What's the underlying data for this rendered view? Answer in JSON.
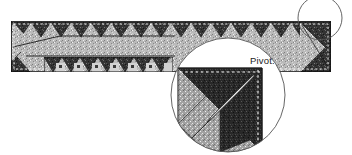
{
  "figure": {
    "kind": "quilting-instruction-diagram",
    "background_color": "#ffffff",
    "ink_color": "#1c1c1c",
    "annotations": [
      {
        "id": "pivot",
        "text": "Pivot.",
        "x": 250,
        "y": 64
      }
    ]
  },
  "strip": {
    "name": "sawtooth-border-strip",
    "x": 11,
    "y": 21,
    "width": 320,
    "height": 51,
    "border_color": "#111111",
    "basting_stitch_color": "#ffffff",
    "background_fabric": "light-speckle",
    "background_color": "#b9b9b9",
    "triangle_fabric": "dark-speckle",
    "triangle_color": "#3b3b3b",
    "teeth_count": 16,
    "tooth_width": 20,
    "tooth_height": 15
  },
  "lower_band": {
    "name": "pieced-checker-band",
    "x": 44,
    "y": 57,
    "width": 129,
    "height": 15,
    "light_color": "#cfcfcf",
    "dark_color": "#3b3b3b",
    "mid_color": "#8e8e8e",
    "square_count": 7
  },
  "locator_circle": {
    "name": "detail-locator-circle",
    "cx": 320,
    "cy": 18,
    "r": 22,
    "stroke": "#555555",
    "stroke_width": 0.8,
    "fill": "none"
  },
  "detail_circle": {
    "name": "magnified-detail-circle",
    "cx": 228,
    "cy": 95,
    "r": 57,
    "stroke": "#555555",
    "stroke_width": 0.8,
    "fill": "#ffffff"
  },
  "detail_block": {
    "name": "magnified-pivot-block",
    "x": 178,
    "y": 68,
    "size": 84,
    "corner_triangle_color": "#2b2b2b",
    "side_triangle_color": "#9d9d9d",
    "seam_allowance_color": "#ffffff",
    "needle_color": "#d8d8d8",
    "needle_outline": "#1c1c1c",
    "needle_angle_deg": 45
  },
  "colors": {
    "dark": "#2b2b2b",
    "mid_dark": "#3b3b3b",
    "mid": "#8e8e8e",
    "light": "#b9b9b9",
    "lighter": "#cfcfcf",
    "line": "#1c1c1c",
    "thin_line": "#555555",
    "white": "#ffffff"
  }
}
